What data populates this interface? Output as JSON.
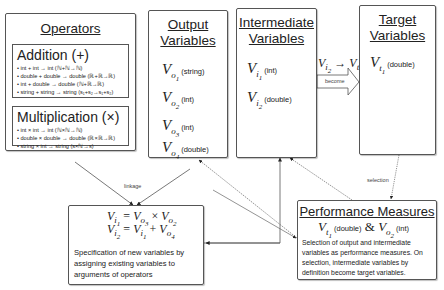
{
  "operators": {
    "title": "Operators",
    "groups": [
      {
        "name": "Addition (+)",
        "rules": [
          "• int + int → int (ℕ+ℕ→ℕ)",
          "• double + double → double (ℝ+ℝ→ℝ)",
          "• int + double → double (ℕ+ℝ→ℝ)",
          "• string + string → string (s₁+s₂→s₁+s₂)"
        ]
      },
      {
        "name": "Multiplication (×)",
        "rules": [
          "• int × int → int (ℕ×ℕ→ℕ)",
          "• double × double → double (ℝ×ℝ→ℝ)",
          "• string × int → string (s×ℕ→s)"
        ]
      }
    ]
  },
  "output_variables": {
    "title_line1": "Output",
    "title_line2": "Variables",
    "items": [
      {
        "sub": "o",
        "idx": "1",
        "type": "(string)"
      },
      {
        "sub": "o",
        "idx": "2",
        "type": "(int)"
      },
      {
        "sub": "o",
        "idx": "3",
        "type": "(int)"
      },
      {
        "sub": "o",
        "idx": "4",
        "type": "(double)"
      }
    ]
  },
  "intermediate_variables": {
    "title_line1": "Intermediate",
    "title_line2": "Variables",
    "items": [
      {
        "sub": "i",
        "idx": "1",
        "type": "(int)"
      },
      {
        "sub": "i",
        "idx": "2",
        "type": "(double)"
      }
    ]
  },
  "target_variables": {
    "title_line1": "Target",
    "title_line2": "Variables",
    "items": [
      {
        "sub": "t",
        "idx": "1",
        "type": "(double)"
      }
    ]
  },
  "become_arrow": {
    "from": {
      "sub": "i",
      "idx": "2"
    },
    "to": {
      "sub": "t",
      "idx": "1"
    },
    "label": "become"
  },
  "specification": {
    "equations": [
      {
        "lhs": {
          "sub": "i",
          "idx": "1"
        },
        "op": "=",
        "a": {
          "sub": "o",
          "idx": "3"
        },
        "operator": "×",
        "b": {
          "sub": "o",
          "idx": "2"
        }
      },
      {
        "lhs": {
          "sub": "i",
          "idx": "2"
        },
        "op": "=",
        "a": {
          "sub": "i",
          "idx": "1"
        },
        "operator": "+",
        "b": {
          "sub": "o",
          "idx": "4"
        }
      }
    ],
    "description": "Specification of new variables by assigning existing variables to arguments of operators"
  },
  "performance_measures": {
    "title": "Performance Measures",
    "measure1": {
      "sub": "t",
      "idx": "1",
      "type": "(double)"
    },
    "conjunction": "&",
    "measure2": {
      "sub": "o",
      "idx": "2",
      "type": "(int)"
    },
    "description": "Selection of output and intermediate variables as performance measures. On selection, intermediate variables by definition become target variables."
  },
  "edge_labels": {
    "linkage": "linkage",
    "selection": "selection"
  }
}
